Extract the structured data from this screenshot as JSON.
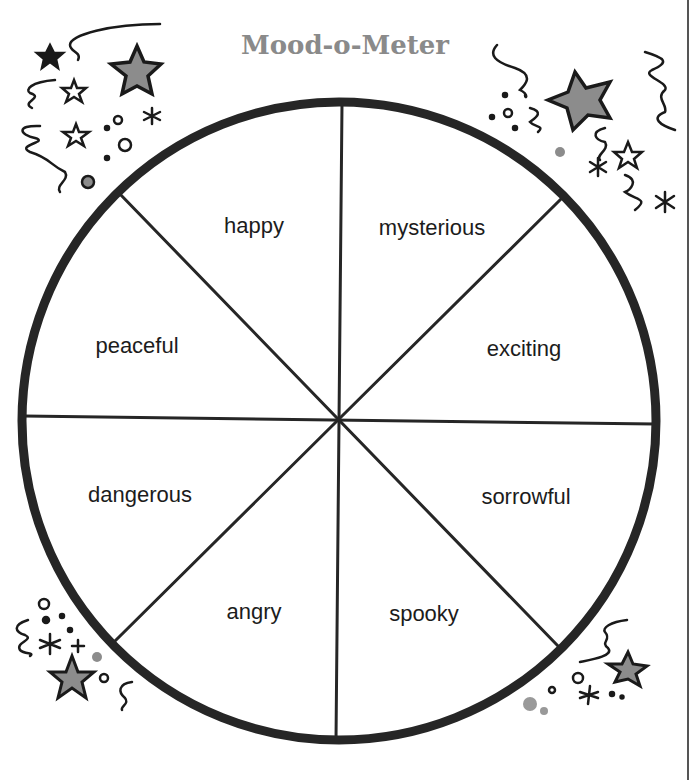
{
  "title": "Mood-o-Meter",
  "wheel": {
    "segments": [
      {
        "label": "happy"
      },
      {
        "label": "mysterious"
      },
      {
        "label": "exciting"
      },
      {
        "label": "sorrowful"
      },
      {
        "label": "spooky"
      },
      {
        "label": "angry"
      },
      {
        "label": "dangerous"
      },
      {
        "label": "peaceful"
      }
    ]
  },
  "colors": {
    "outline": "#262626",
    "title": "#8a8a8a",
    "star_fill": "#8c8c8c"
  },
  "decorations": [
    "star-icon",
    "squiggle-icon",
    "asterisk-icon",
    "dot-icon"
  ]
}
